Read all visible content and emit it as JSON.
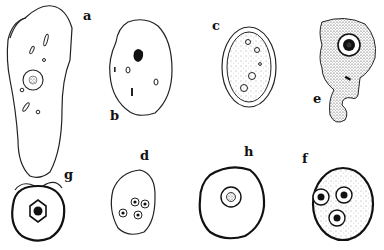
{
  "figure": {
    "labels": {
      "a": "a",
      "b": "b",
      "c": "c",
      "d": "d",
      "e": "e",
      "f": "f",
      "g": "g",
      "h": "h"
    },
    "colors": {
      "ink": "#1a1a1a",
      "background": "#ffffff"
    }
  }
}
